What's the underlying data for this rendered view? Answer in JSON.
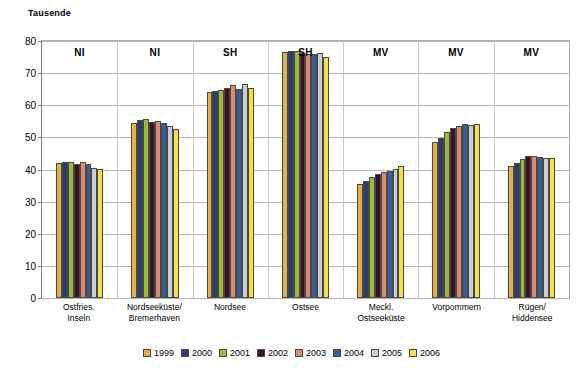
{
  "chart_data": {
    "type": "bar",
    "title": "Tausende",
    "xlabel": "",
    "ylabel": "Tausende",
    "ylim": [
      0,
      80
    ],
    "yticks": [
      0,
      10,
      20,
      30,
      40,
      50,
      60,
      70,
      80
    ],
    "grid": true,
    "legend_position": "bottom",
    "categories": [
      "Ostfries. Inseln",
      "Nordseeküste/ Bremerhaven",
      "Nordsee",
      "Ostsee",
      "Meckl. Ostseeküste",
      "Vorpommern",
      "Rügen/ Hiddensee"
    ],
    "category_lines": [
      [
        "Ostfries.",
        "Inseln"
      ],
      [
        "Nordseeküste/",
        "Bremerhaven"
      ],
      [
        "Nordsee",
        ""
      ],
      [
        "Ostsee",
        ""
      ],
      [
        "Meckl.",
        "Ostseeküste"
      ],
      [
        "Vorpommern",
        ""
      ],
      [
        "Rügen/",
        "Hiddensee"
      ]
    ],
    "group_tags": [
      "NI",
      "NI",
      "SH",
      "SH",
      "MV",
      "MV",
      "MV"
    ],
    "series": [
      {
        "name": "1999",
        "color": "#E3B04B",
        "values": [
          41.8,
          54.2,
          63.6,
          76.0,
          35.2,
          48.2,
          40.8
        ]
      },
      {
        "name": "2000",
        "color": "#2B3C76",
        "values": [
          42.0,
          55.1,
          63.9,
          76.2,
          36.0,
          49.3,
          41.7
        ]
      },
      {
        "name": "2001",
        "color": "#9DB83C",
        "values": [
          42.0,
          55.2,
          64.2,
          76.2,
          37.4,
          51.2,
          43.0
        ]
      },
      {
        "name": "2002",
        "color": "#38122E",
        "values": [
          41.3,
          54.5,
          64.8,
          75.6,
          38.3,
          52.6,
          43.8
        ]
      },
      {
        "name": "2003",
        "color": "#D98C73",
        "values": [
          42.1,
          54.6,
          65.8,
          75.4,
          38.9,
          53.1,
          43.8
        ]
      },
      {
        "name": "2004",
        "color": "#3A5D99",
        "values": [
          41.3,
          54.2,
          64.5,
          75.5,
          39.3,
          53.9,
          43.5
        ]
      },
      {
        "name": "2005",
        "color": "#C9CEDD",
        "values": [
          40.1,
          53.1,
          66.2,
          75.6,
          40.0,
          53.4,
          43.4
        ]
      },
      {
        "name": "2006",
        "color": "#F2E14C",
        "values": [
          40.0,
          52.2,
          64.9,
          74.5,
          40.8,
          53.9,
          43.2
        ]
      }
    ]
  },
  "legend": {
    "items": [
      {
        "label": "1999"
      },
      {
        "label": "2000"
      },
      {
        "label": "2001"
      },
      {
        "label": "2002"
      },
      {
        "label": "2003"
      },
      {
        "label": "2004"
      },
      {
        "label": "2005"
      },
      {
        "label": "2006"
      }
    ]
  }
}
